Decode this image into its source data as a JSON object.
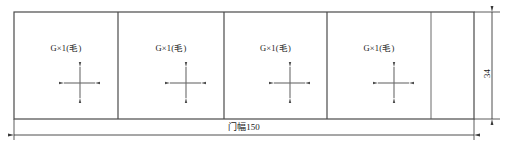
{
  "drawing": {
    "title": "door-panel-cutting-layout",
    "line_color": "#4a4a4a",
    "text_color": "#1a1a1a",
    "background": "#ffffff",
    "frame": {
      "x": 14,
      "y": 12,
      "width": 460,
      "height": 107
    },
    "panels": [
      {
        "id": "panel-1",
        "x": 14,
        "width": 104,
        "label": "G×1(毛)",
        "has_grain_symbol": true
      },
      {
        "id": "panel-2",
        "x": 118,
        "width": 106,
        "label": "G×1(毛)",
        "has_grain_symbol": true
      },
      {
        "id": "panel-3",
        "x": 224,
        "width": 103,
        "label": "G×1(毛)",
        "has_grain_symbol": true
      },
      {
        "id": "panel-4",
        "x": 327,
        "width": 104,
        "label": "G×1(毛)",
        "has_grain_symbol": true
      },
      {
        "id": "panel-5",
        "x": 431,
        "width": 43,
        "label": "",
        "has_grain_symbol": false
      }
    ],
    "dimensions": {
      "width": {
        "name": "overall-width",
        "text": "门幅150",
        "value": 150,
        "unit": "",
        "line_y": 135,
        "from_x": 14,
        "to_x": 474
      },
      "height": {
        "name": "overall-height",
        "text": "34",
        "value": 34,
        "unit": "",
        "line_x": 492,
        "from_y": 12,
        "to_y": 119
      }
    },
    "grain_symbol": {
      "name": "grain-direction-cross",
      "description": "four-headed arrow cross indicating grain direction"
    }
  }
}
